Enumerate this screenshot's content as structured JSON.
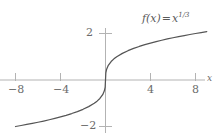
{
  "figure": {
    "background_color": "#ffffff",
    "axis_color": "#b3b3b3",
    "curve_color": "#555555",
    "text_color": "#6b6b6b"
  },
  "function_label": {
    "f_of_x": "f(x)",
    "equals": "=",
    "base": "x",
    "exponent": "1/3"
  },
  "axis_names": {
    "x": "x"
  },
  "chart_data": {
    "type": "line",
    "title": "",
    "subtitle": "",
    "xlabel": "x",
    "ylabel": "",
    "legend": [
      "f(x) = x^(1/3)"
    ],
    "legend_position": "top-right",
    "grid": false,
    "xlim": [
      -9.3,
      9.1
    ],
    "ylim": [
      -2.5,
      2.5
    ],
    "xticks": [
      -8,
      -4,
      4,
      8
    ],
    "xtick_labels": [
      "−8",
      "−4",
      "4",
      "8"
    ],
    "yticks": [
      2,
      -2
    ],
    "ytick_labels": [
      "2",
      "−2"
    ],
    "series": [
      {
        "name": "f(x) = x^(1/3)",
        "expression": "x^(1/3)",
        "color": "#555555",
        "x": [
          -8.0,
          -7.5,
          -7.0,
          -6.5,
          -6.0,
          -5.5,
          -5.0,
          -4.5,
          -4.0,
          -3.5,
          -3.0,
          -2.5,
          -2.0,
          -1.5,
          -1.0,
          -0.75,
          -0.5,
          -0.25,
          -0.1,
          -0.03,
          0.0,
          0.03,
          0.1,
          0.25,
          0.5,
          0.75,
          1.0,
          1.5,
          2.0,
          2.5,
          3.0,
          3.5,
          4.0,
          4.5,
          5.0,
          5.5,
          6.0,
          6.5,
          7.0,
          7.5,
          8.0,
          8.5,
          9.0
        ],
        "y": [
          -2.0,
          -1.957,
          -1.913,
          -1.866,
          -1.817,
          -1.765,
          -1.71,
          -1.651,
          -1.587,
          -1.518,
          -1.442,
          -1.357,
          -1.26,
          -1.145,
          -1.0,
          -0.909,
          -0.794,
          -0.63,
          -0.464,
          -0.311,
          0.0,
          0.311,
          0.464,
          0.63,
          0.794,
          0.909,
          1.0,
          1.145,
          1.26,
          1.357,
          1.442,
          1.518,
          1.587,
          1.651,
          1.71,
          1.765,
          1.817,
          1.866,
          1.913,
          1.957,
          2.0,
          2.041,
          2.08
        ]
      }
    ],
    "annotations": [
      {
        "text": "f(x) = x^(1/3)",
        "x": 5.2,
        "y": 2.35
      }
    ]
  }
}
